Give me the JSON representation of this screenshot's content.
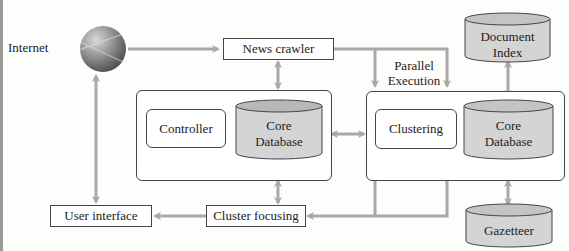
{
  "diagram": {
    "nodes": {
      "internet": "Internet",
      "news_crawler": "News crawler",
      "parallel_execution_line1": "Parallel",
      "parallel_execution_line2": "Execution",
      "document_index_line1": "Document",
      "document_index_line2": "Index",
      "controller": "Controller",
      "core_db_left_line1": "Core",
      "core_db_left_line2": "Database",
      "clustering": "Clustering",
      "core_db_right_line1": "Core",
      "core_db_right_line2": "Database",
      "user_interface": "User interface",
      "cluster_focusing": "Cluster focusing",
      "gazetteer": "Gazetteer"
    },
    "edges": [
      {
        "from": "Internet",
        "to": "News crawler",
        "type": "directed"
      },
      {
        "from": "News crawler",
        "to": "Left group (Controller/Core Database)",
        "type": "bidirectional"
      },
      {
        "from": "News crawler",
        "to": "Right group (Clustering/Core Database)",
        "type": "directed",
        "label": "Parallel Execution"
      },
      {
        "from": "Document Index",
        "to": "Right Core Database",
        "type": "bidirectional"
      },
      {
        "from": "Left group",
        "to": "Right group",
        "type": "bidirectional"
      },
      {
        "from": "Left group",
        "to": "Cluster focusing",
        "type": "bidirectional"
      },
      {
        "from": "Right group",
        "to": "Cluster focusing",
        "type": "directed"
      },
      {
        "from": "Right Core Database",
        "to": "Gazetteer",
        "type": "bidirectional"
      },
      {
        "from": "Cluster focusing",
        "to": "User interface",
        "type": "directed"
      },
      {
        "from": "User interface",
        "to": "Internet",
        "type": "bidirectional"
      }
    ],
    "colors": {
      "arrow": "#a8a8a8",
      "border": "#444444",
      "cylinder_fill": "#d4d4d4"
    }
  }
}
